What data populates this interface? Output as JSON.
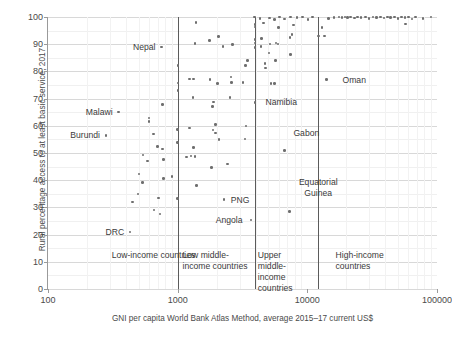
{
  "chart_data": {
    "type": "scatter",
    "title": "",
    "xlabel": "GNI per capita World Bank Atlas Method, average 2015–17 current US$",
    "ylabel": "Rural percentage access to at least basic service, 2017",
    "xscale": "log",
    "xlim": [
      100,
      100000
    ],
    "ylim": [
      0,
      100
    ],
    "grid": true,
    "legend": "none",
    "xticks": [
      {
        "value": 100,
        "label": "100"
      },
      {
        "value": 1000,
        "label": "1000"
      },
      {
        "value": 10000,
        "label": "10000"
      },
      {
        "value": 100000,
        "label": "100000"
      }
    ],
    "yticks": [
      {
        "value": 0,
        "label": "0"
      },
      {
        "value": 10,
        "label": "10"
      },
      {
        "value": 20,
        "label": "20"
      },
      {
        "value": 30,
        "label": "30"
      },
      {
        "value": 40,
        "label": "40"
      },
      {
        "value": 50,
        "label": "50"
      },
      {
        "value": 60,
        "label": "60"
      },
      {
        "value": 70,
        "label": "70"
      },
      {
        "value": 80,
        "label": "80"
      },
      {
        "value": 90,
        "label": "90"
      },
      {
        "value": 100,
        "label": "100"
      }
    ],
    "dividers": [
      {
        "value": 1005,
        "name": "low-income-upper-bound"
      },
      {
        "value": 3955,
        "name": "low-middle-income-upper-bound"
      },
      {
        "value": 12055,
        "name": "upper-middle-income-upper-bound"
      }
    ],
    "group_labels": [
      {
        "id": "low-income",
        "text": "Low-income countries",
        "x": 310,
        "y": 14.5
      },
      {
        "id": "low-middle-income",
        "text": "Low middle-\nincome countries",
        "x": 1090,
        "y": 14.5
      },
      {
        "id": "upper-middle-income",
        "text": "Upper\nmiddle-\nincome\ncountries",
        "x": 4150,
        "y": 14.5
      },
      {
        "id": "high-income",
        "text": "High-income\ncountries",
        "x": 16500,
        "y": 14.5
      }
    ],
    "annotations": [
      {
        "label": "Nepal",
        "x": 750,
        "y": 89.0,
        "align": "right"
      },
      {
        "label": "Malawi",
        "x": 350,
        "y": 65.0,
        "align": "right"
      },
      {
        "label": "Burundi",
        "x": 280,
        "y": 56.5,
        "align": "right"
      },
      {
        "label": "DRC",
        "x": 430,
        "y": 21.0,
        "align": "right"
      },
      {
        "label": "PNG",
        "x": 2270,
        "y": 32.8,
        "align": "left"
      },
      {
        "label": "Angola",
        "x": 3520,
        "y": 25.3,
        "align": "right"
      },
      {
        "label": "Namibia",
        "x": 4200,
        "y": 68.6,
        "align": "left"
      },
      {
        "label": "Gabon",
        "x": 6900,
        "y": 57.5,
        "align": "left"
      },
      {
        "label": "Equatorial\nGuinea",
        "x": 7600,
        "y": 37.5,
        "align": "left"
      },
      {
        "label": "Oman",
        "x": 16500,
        "y": 77.0,
        "align": "left"
      }
    ],
    "points": [
      {
        "x": 350,
        "y": 65.0,
        "label": "Malawi"
      },
      {
        "x": 280,
        "y": 56.5,
        "label": "Burundi"
      },
      {
        "x": 750,
        "y": 89.0,
        "label": "Nepal"
      },
      {
        "x": 430,
        "y": 21.0,
        "label": "DRC"
      },
      {
        "x": 765,
        "y": 67.8
      },
      {
        "x": 600,
        "y": 62.8
      },
      {
        "x": 600,
        "y": 61.6
      },
      {
        "x": 648,
        "y": 57.0
      },
      {
        "x": 700,
        "y": 52.3
      },
      {
        "x": 763,
        "y": 51.4
      },
      {
        "x": 540,
        "y": 49.3
      },
      {
        "x": 780,
        "y": 47.6
      },
      {
        "x": 585,
        "y": 47.0
      },
      {
        "x": 505,
        "y": 42.3
      },
      {
        "x": 905,
        "y": 41.4
      },
      {
        "x": 775,
        "y": 40.6
      },
      {
        "x": 537,
        "y": 39.2
      },
      {
        "x": 495,
        "y": 35.0
      },
      {
        "x": 448,
        "y": 32.0
      },
      {
        "x": 715,
        "y": 33.5
      },
      {
        "x": 655,
        "y": 29.0
      },
      {
        "x": 730,
        "y": 27.6
      },
      {
        "x": 1005,
        "y": 82.2
      },
      {
        "x": 1005,
        "y": 75.8
      },
      {
        "x": 1005,
        "y": 73.0
      },
      {
        "x": 1000,
        "y": 58.6
      },
      {
        "x": 1000,
        "y": 53.9
      },
      {
        "x": 1000,
        "y": 33.3
      },
      {
        "x": 1380,
        "y": 98.0
      },
      {
        "x": 1360,
        "y": 90.3
      },
      {
        "x": 1760,
        "y": 91.3
      },
      {
        "x": 2075,
        "y": 92.8
      },
      {
        "x": 2240,
        "y": 89.2
      },
      {
        "x": 2650,
        "y": 89.9
      },
      {
        "x": 1230,
        "y": 77.2
      },
      {
        "x": 1320,
        "y": 77.2
      },
      {
        "x": 1770,
        "y": 77.0
      },
      {
        "x": 2570,
        "y": 78.0
      },
      {
        "x": 3340,
        "y": 82.2
      },
      {
        "x": 3470,
        "y": 84.0
      },
      {
        "x": 3190,
        "y": 76.0
      },
      {
        "x": 2600,
        "y": 76.0
      },
      {
        "x": 2020,
        "y": 75.6
      },
      {
        "x": 1310,
        "y": 70.3
      },
      {
        "x": 1890,
        "y": 68.8
      },
      {
        "x": 1860,
        "y": 67.2
      },
      {
        "x": 2540,
        "y": 70.3
      },
      {
        "x": 1230,
        "y": 59.2
      },
      {
        "x": 1960,
        "y": 60.5
      },
      {
        "x": 1870,
        "y": 58.4
      },
      {
        "x": 1960,
        "y": 57.3
      },
      {
        "x": 3360,
        "y": 60.0
      },
      {
        "x": 2080,
        "y": 55.0
      },
      {
        "x": 3300,
        "y": 55.2
      },
      {
        "x": 1330,
        "y": 52.1
      },
      {
        "x": 1170,
        "y": 48.6
      },
      {
        "x": 1270,
        "y": 48.9
      },
      {
        "x": 1360,
        "y": 48.7
      },
      {
        "x": 1820,
        "y": 44.6
      },
      {
        "x": 2430,
        "y": 46.0
      },
      {
        "x": 1400,
        "y": 38.0
      },
      {
        "x": 2270,
        "y": 32.8,
        "label": "PNG"
      },
      {
        "x": 3690,
        "y": 25.3,
        "label": "Angola"
      },
      {
        "x": 3960,
        "y": 97.3
      },
      {
        "x": 3960,
        "y": 96.3
      },
      {
        "x": 3955,
        "y": 91.8
      },
      {
        "x": 3950,
        "y": 90.5
      },
      {
        "x": 3955,
        "y": 88.8
      },
      {
        "x": 3900,
        "y": 100.0
      },
      {
        "x": 4300,
        "y": 99.4
      },
      {
        "x": 4600,
        "y": 97.8
      },
      {
        "x": 5100,
        "y": 99.6
      },
      {
        "x": 5600,
        "y": 99.0
      },
      {
        "x": 6100,
        "y": 100.0
      },
      {
        "x": 6700,
        "y": 99.3
      },
      {
        "x": 7400,
        "y": 100.0
      },
      {
        "x": 8300,
        "y": 99.8
      },
      {
        "x": 9200,
        "y": 100.0
      },
      {
        "x": 10100,
        "y": 99.1
      },
      {
        "x": 11000,
        "y": 100.0
      },
      {
        "x": 4450,
        "y": 92.0
      },
      {
        "x": 5150,
        "y": 90.0
      },
      {
        "x": 5750,
        "y": 90.4
      },
      {
        "x": 5950,
        "y": 90.1
      },
      {
        "x": 7350,
        "y": 92.5
      },
      {
        "x": 7600,
        "y": 93.5
      },
      {
        "x": 7800,
        "y": 97.0
      },
      {
        "x": 6000,
        "y": 96.2
      },
      {
        "x": 4400,
        "y": 89.2
      },
      {
        "x": 5050,
        "y": 86.8
      },
      {
        "x": 7450,
        "y": 86.2
      },
      {
        "x": 4700,
        "y": 83.0
      },
      {
        "x": 4780,
        "y": 81.3
      },
      {
        "x": 5700,
        "y": 84.1
      },
      {
        "x": 5250,
        "y": 75.5
      },
      {
        "x": 5600,
        "y": 75.5
      },
      {
        "x": 3960,
        "y": 68.6,
        "label": "Namibia"
      },
      {
        "x": 6700,
        "y": 51.0
      },
      {
        "x": 7300,
        "y": 28.6
      },
      {
        "x": 12200,
        "y": 93.0
      },
      {
        "x": 13500,
        "y": 93.0
      },
      {
        "x": 13000,
        "y": 96.2
      },
      {
        "x": 14500,
        "y": 99.5
      },
      {
        "x": 16000,
        "y": 99.9
      },
      {
        "x": 17500,
        "y": 100.0
      },
      {
        "x": 18500,
        "y": 99.8
      },
      {
        "x": 19500,
        "y": 100.0
      },
      {
        "x": 20500,
        "y": 99.9
      },
      {
        "x": 21500,
        "y": 100.0
      },
      {
        "x": 23000,
        "y": 99.6
      },
      {
        "x": 24500,
        "y": 100.0
      },
      {
        "x": 26000,
        "y": 99.9
      },
      {
        "x": 28000,
        "y": 100.0
      },
      {
        "x": 30000,
        "y": 99.4
      },
      {
        "x": 32000,
        "y": 100.0
      },
      {
        "x": 34000,
        "y": 99.8
      },
      {
        "x": 36500,
        "y": 100.0
      },
      {
        "x": 39000,
        "y": 99.6
      },
      {
        "x": 41500,
        "y": 100.0
      },
      {
        "x": 44000,
        "y": 99.9
      },
      {
        "x": 47000,
        "y": 100.0
      },
      {
        "x": 50000,
        "y": 99.5
      },
      {
        "x": 53000,
        "y": 100.0
      },
      {
        "x": 56500,
        "y": 99.8
      },
      {
        "x": 60000,
        "y": 100.0
      },
      {
        "x": 57000,
        "y": 97.5
      },
      {
        "x": 64000,
        "y": 99.3
      },
      {
        "x": 68000,
        "y": 100.0
      },
      {
        "x": 78000,
        "y": 99.5
      },
      {
        "x": 90000,
        "y": 100.0
      },
      {
        "x": 14000,
        "y": 77.0,
        "label": "Oman"
      }
    ]
  }
}
